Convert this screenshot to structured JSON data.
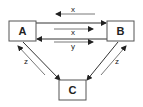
{
  "diagram": {
    "nodes": [
      {
        "id": "A",
        "label": "A"
      },
      {
        "id": "B",
        "label": "B"
      },
      {
        "id": "C",
        "label": "C"
      }
    ],
    "edges": [
      {
        "from": "A",
        "to": "B",
        "label": ""
      },
      {
        "from": "B",
        "to": "A",
        "label": ""
      },
      {
        "from": "A",
        "to": "C",
        "label": ""
      },
      {
        "from": "C",
        "to": "A",
        "label": ""
      },
      {
        "from": "B",
        "to": "C",
        "label": ""
      },
      {
        "from": "C",
        "to": "B",
        "label": ""
      }
    ],
    "flow_labels": [
      {
        "id": "top",
        "label": "x",
        "direction": "B to A"
      },
      {
        "id": "mid",
        "label": "x",
        "direction": "A to B"
      },
      {
        "id": "low",
        "label": "y",
        "direction": "A to B"
      },
      {
        "id": "left",
        "label": "z",
        "direction": "C to A"
      },
      {
        "id": "right",
        "label": "z",
        "direction": "C to B"
      }
    ],
    "colors": {
      "stroke": "#333333",
      "box_border": "#555555",
      "text": "#222222",
      "background": "#ffffff"
    }
  }
}
